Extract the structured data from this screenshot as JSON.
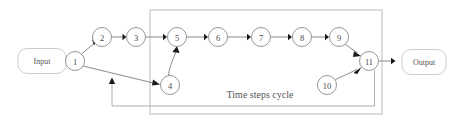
{
  "diagram": {
    "type": "flow-graph",
    "caption": "Time steps cycle",
    "terminals": [
      {
        "id": "input",
        "label": "Input",
        "x": 42,
        "y": 61,
        "w": 48,
        "h": 25
      },
      {
        "id": "output",
        "label": "Output",
        "x": 424,
        "y": 62,
        "w": 44,
        "h": 25
      }
    ],
    "nodes": [
      {
        "id": "n1",
        "label": "1",
        "cx": 75,
        "cy": 61,
        "r": 9.5
      },
      {
        "id": "n2",
        "label": "2",
        "cx": 102,
        "cy": 37,
        "r": 9.5
      },
      {
        "id": "n3",
        "label": "3",
        "cx": 136,
        "cy": 37,
        "r": 9.5
      },
      {
        "id": "n4",
        "label": "4",
        "cx": 170,
        "cy": 85,
        "r": 9.5
      },
      {
        "id": "n5",
        "label": "5",
        "cx": 177,
        "cy": 37,
        "r": 9.5
      },
      {
        "id": "n6",
        "label": "6",
        "cx": 218,
        "cy": 37,
        "r": 9.5
      },
      {
        "id": "n7",
        "label": "7",
        "cx": 261,
        "cy": 37,
        "r": 9.5
      },
      {
        "id": "n8",
        "label": "8",
        "cx": 302,
        "cy": 37,
        "r": 9.5
      },
      {
        "id": "n9",
        "label": "9",
        "cx": 339,
        "cy": 37,
        "r": 9.5
      },
      {
        "id": "n10",
        "label": "10",
        "cx": 327,
        "cy": 85,
        "r": 9.5
      },
      {
        "id": "n11",
        "label": "11",
        "cx": 369,
        "cy": 61,
        "r": 9.5
      }
    ],
    "edges": [
      {
        "from": "input",
        "to": "n1"
      },
      {
        "from": "n1",
        "to": "n2"
      },
      {
        "from": "n2",
        "to": "n3"
      },
      {
        "from": "n3",
        "to": "n5"
      },
      {
        "from": "n1",
        "to": "n4"
      },
      {
        "from": "n4",
        "to": "n5"
      },
      {
        "from": "n5",
        "to": "n6"
      },
      {
        "from": "n6",
        "to": "n7"
      },
      {
        "from": "n7",
        "to": "n8"
      },
      {
        "from": "n8",
        "to": "n9"
      },
      {
        "from": "n9",
        "to": "n11"
      },
      {
        "from": "n10",
        "to": "n11"
      },
      {
        "from": "n11",
        "to": "output"
      },
      {
        "from": "n11",
        "to": "n1-n4-edge",
        "kind": "feedback"
      }
    ],
    "cycle_box": {
      "x": 150,
      "y": 10,
      "w": 232,
      "h": 104
    },
    "caption_pos": {
      "x": 260,
      "y": 94
    },
    "colors": {
      "node_stroke": "#8a8a8a",
      "edge": "#6e6e6e",
      "arrow": "#1a1a1a",
      "box": "#b4b4b4",
      "terminal_stroke": "#c8c8c8",
      "text": "#4a4a4a",
      "background": "#ffffff"
    }
  }
}
